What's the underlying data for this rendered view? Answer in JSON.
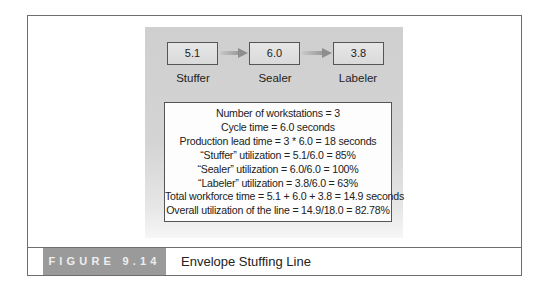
{
  "figure": {
    "label": "FIGURE 9.14",
    "title": "Envelope Stuffing Line"
  },
  "stations": [
    {
      "name": "Stuffer",
      "time": "5.1"
    },
    {
      "name": "Sealer",
      "time": "6.0"
    },
    {
      "name": "Labeler",
      "time": "3.8"
    }
  ],
  "stats": [
    "Number of workstations = 3",
    "Cycle time = 6.0 seconds",
    "Production lead time = 3 * 6.0 = 18 seconds",
    "“Stuffer” utilization = 5.1/6.0 = 85%",
    "“Sealer” utilization = 6.0/6.0 = 100%",
    "“Labeler” utilization = 3.8/6.0 = 63%",
    "Total workforce time = 5.1 + 6.0 + 3.8 = 14.9 seconds",
    "Overall utilization of the line = 14.9/18.0 = 82.78%"
  ],
  "colors": {
    "panel": "#d2d2d2",
    "label_bg": "#9a9a9a",
    "border": "#6e6e6e"
  }
}
